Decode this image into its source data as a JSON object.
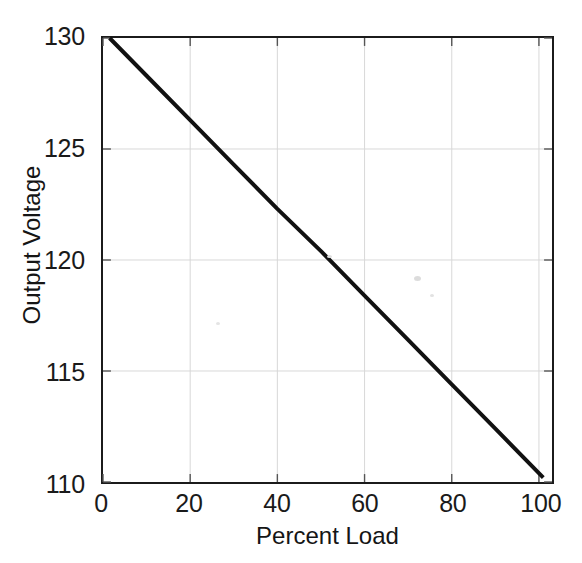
{
  "chart_data": {
    "type": "line",
    "title": "",
    "subtitle": "",
    "xlabel": "Percent Load",
    "ylabel": "Output Voltage",
    "xlim": [
      0,
      103
    ],
    "ylim": [
      110,
      130
    ],
    "xticks": [
      0,
      20,
      40,
      60,
      80,
      100
    ],
    "yticks": [
      110,
      115,
      120,
      125,
      130
    ],
    "xtick_labels": [
      "0",
      "20",
      "40",
      "60",
      "80",
      "100"
    ],
    "ytick_labels": [
      "110",
      "115",
      "120",
      "125",
      "130"
    ],
    "grid": true,
    "legend": null,
    "legend_position": "none",
    "series": [
      {
        "name": "Output Voltage",
        "color": "#111111",
        "line_width": 4,
        "x": [
          1.5,
          10,
          20,
          30,
          40,
          50,
          60,
          70,
          80,
          90,
          101
        ],
        "values": [
          130.0,
          128.3,
          126.3,
          124.3,
          122.3,
          120.4,
          118.4,
          116.4,
          114.4,
          112.4,
          110.2
        ]
      }
    ],
    "annotations": []
  },
  "figure": {
    "background_color": "#ffffff",
    "axis_color": "#1b1b1b",
    "grid_color": "#d8d8d8",
    "tick_color": "#555555",
    "text_color": "#1a1a1a"
  }
}
